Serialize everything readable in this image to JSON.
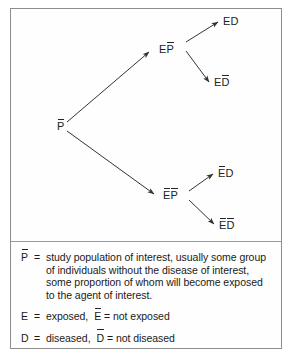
{
  "figure": {
    "type": "tree-diagram"
  },
  "diagram": {
    "root": {
      "id": "root",
      "text": "P",
      "overbars": "P"
    },
    "branch_exposed": {
      "id": "EP",
      "text": "EP",
      "overbars": "P"
    },
    "branch_unexposed": {
      "id": "EbarPbar",
      "text": "EP",
      "overbars": "E,P"
    },
    "leaf_ed": {
      "id": "ED",
      "text": "ED",
      "overbars": ""
    },
    "leaf_edbar": {
      "id": "EDbar",
      "text": "ED",
      "overbars": "D"
    },
    "leaf_ebard": {
      "id": "EbarD",
      "text": "ED",
      "overbars": "E"
    },
    "leaf_ebardbar": {
      "id": "EbarDbar",
      "text": "ED",
      "overbars": "E,D"
    }
  },
  "legend": {
    "population": {
      "symbol": "P",
      "equals": "=",
      "line1": "study population of interest, usually some group",
      "line2": "of individuals without the disease of interest,",
      "line3": "some proportion of whom will become exposed",
      "line4": "to the agent of interest."
    },
    "exposure": {
      "symbol": "E",
      "equals": "=",
      "positive_text": "exposed,",
      "negative_symbol": "E",
      "negative_equals": "=",
      "negative_text": "not exposed"
    },
    "disease": {
      "symbol": "D",
      "equals": "=",
      "positive_text": "diseased,",
      "negative_symbol": "D",
      "negative_equals": "=",
      "negative_text": "not diseased"
    }
  },
  "colors": {
    "border": "#8d8d8d",
    "line": "#333333",
    "text": "#232323",
    "background": "#fefefe"
  }
}
